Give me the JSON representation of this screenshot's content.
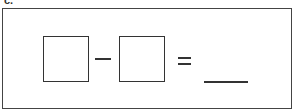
{
  "problem": {
    "label": "c.",
    "expression": {
      "operand1": "",
      "operator": "−",
      "operand2": "",
      "equals": "=",
      "answer": ""
    }
  }
}
